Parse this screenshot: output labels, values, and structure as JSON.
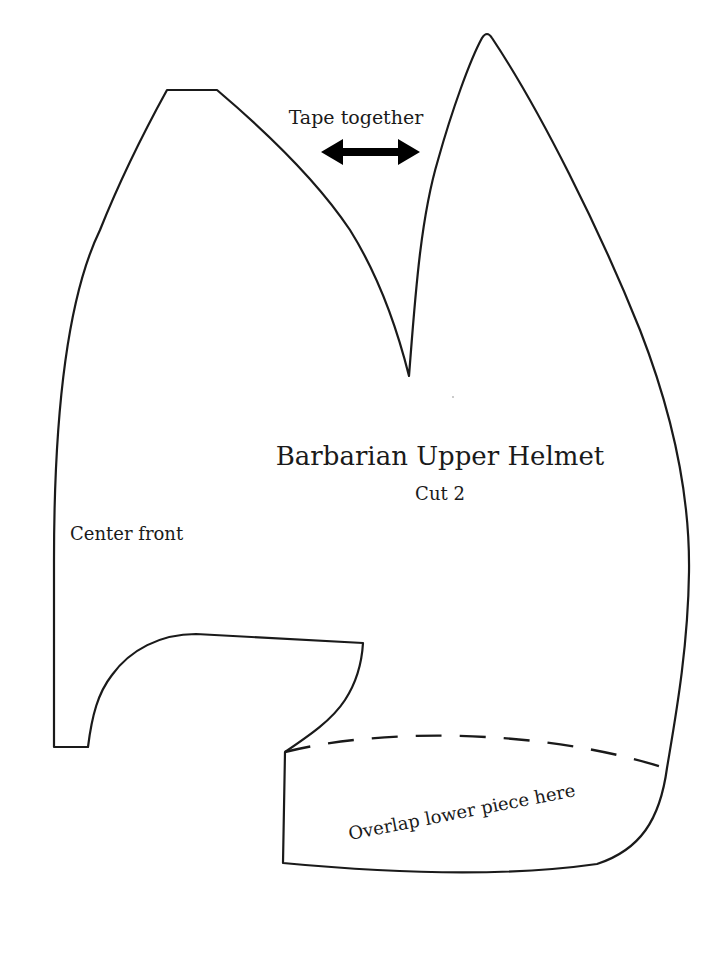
{
  "diagram": {
    "type": "sewing-pattern-piece",
    "title": "Barbarian Upper Helmet",
    "subtitle": "Cut 2",
    "labels": {
      "tape_together": "Tape together",
      "center_front": "Center front",
      "overlap": "Overlap lower piece here"
    },
    "markers": {
      "tape_arrow": "double-headed-arrow",
      "overlap_line": "dashed-line"
    },
    "colors": {
      "outline": "#1a1a1a",
      "background": "#ffffff"
    }
  }
}
